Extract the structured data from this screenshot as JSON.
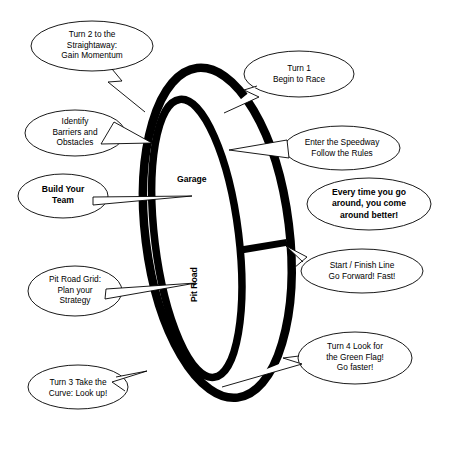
{
  "figure": {
    "type": "annotated-diagram",
    "background_color": "#ffffff",
    "stroke_color": "#000000"
  },
  "track": {
    "labels": [
      {
        "id": "garage",
        "text": "Garage",
        "orientation": "horizontal",
        "bold": true
      },
      {
        "id": "pit-road",
        "text": "Pit Road",
        "orientation": "vertical",
        "bold": true
      }
    ]
  },
  "callouts": [
    {
      "id": "turn-2",
      "text": "Turn 2 to the\nStraightaway:\nGain Momentum",
      "bold": false,
      "position": "top-left"
    },
    {
      "id": "turn-1",
      "text": "Turn 1\nBegin to Race",
      "bold": false,
      "position": "top-right"
    },
    {
      "id": "identify-barriers",
      "text": "Identify\nBarriers and\nObstacles",
      "bold": false,
      "position": "upper-left"
    },
    {
      "id": "enter-speedway",
      "text": "Enter the Speedway\nFollow the Rules",
      "bold": false,
      "position": "upper-right"
    },
    {
      "id": "build-your-team",
      "text": "Build Your\nTeam",
      "bold": true,
      "position": "middle-left"
    },
    {
      "id": "every-time",
      "text": "Every time you go\naround, you come\naround better!",
      "bold": true,
      "position": "middle-right"
    },
    {
      "id": "start-finish",
      "text": "Start / Finish Line\nGo Forward!  Fast!",
      "bold": false,
      "position": "lower-right"
    },
    {
      "id": "pit-road-grid",
      "text": "Pit Road Grid:\nPlan your\nStrategy",
      "bold": false,
      "position": "lower-left"
    },
    {
      "id": "turn-4",
      "text": "Turn 4  Look for\nthe Green Flag!\nGo faster!",
      "bold": false,
      "position": "bottom-right"
    },
    {
      "id": "turn-3",
      "text": "Turn 3 Take the\nCurve: Look up!",
      "bold": false,
      "position": "bottom-left"
    }
  ]
}
